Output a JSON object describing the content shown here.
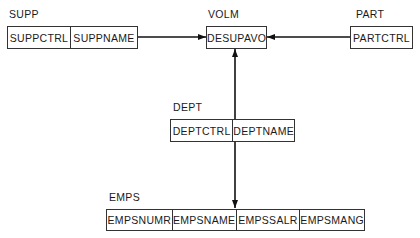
{
  "diagram": {
    "type": "data-structure",
    "entities": [
      {
        "id": "supp",
        "name": "SUPP",
        "fields": [
          "SUPPCTRL",
          "SUPPNAME"
        ]
      },
      {
        "id": "volm",
        "name": "VOLM",
        "fields": [
          "DESUPAVO"
        ]
      },
      {
        "id": "part",
        "name": "PART",
        "fields": [
          "PARTCTRL"
        ]
      },
      {
        "id": "dept",
        "name": "DEPT",
        "fields": [
          "DEPTCTRL",
          "DEPTNAME"
        ]
      },
      {
        "id": "emps",
        "name": "EMPS",
        "fields": [
          "EMPSNUMR",
          "EMPSNAME",
          "EMPSSALR",
          "EMPSMANG"
        ]
      }
    ],
    "connections": [
      {
        "from": "SUPP",
        "to": "VOLM",
        "arrow": "end"
      },
      {
        "from": "PART",
        "to": "VOLM",
        "arrow": "end"
      },
      {
        "from": "DEPT",
        "to": "VOLM",
        "arrow": "end"
      },
      {
        "from": "DEPT",
        "to": "EMPS",
        "arrow": "end"
      }
    ]
  }
}
